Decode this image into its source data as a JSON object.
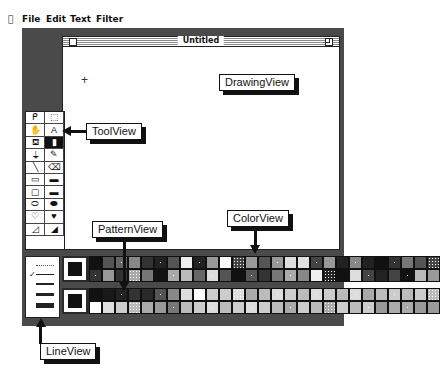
{
  "menubar": {
    "apple": "",
    "items": [
      "File",
      "Edit",
      "Text",
      "Filter"
    ]
  },
  "window": {
    "title": "Untitled",
    "cursor": "+"
  },
  "tool_palette": {
    "tools": [
      {
        "name": "lasso-icon",
        "glyph": "ᑭ"
      },
      {
        "name": "marquee-select-icon",
        "glyph": "⬚"
      },
      {
        "name": "hand-icon",
        "glyph": "✋"
      },
      {
        "name": "text-tool-icon",
        "glyph": "A"
      },
      {
        "name": "paint-bucket-icon",
        "glyph": "⛾"
      },
      {
        "name": "spray-can-icon",
        "glyph": "▮",
        "selected": true
      },
      {
        "name": "brush-icon",
        "glyph": "⍊"
      },
      {
        "name": "pencil-icon",
        "glyph": "✎"
      },
      {
        "name": "line-tool-icon",
        "glyph": "╲"
      },
      {
        "name": "eraser-icon",
        "glyph": "⌫"
      },
      {
        "name": "rectangle-icon",
        "glyph": "▭"
      },
      {
        "name": "filled-rectangle-icon",
        "glyph": "▬"
      },
      {
        "name": "rounded-rectangle-icon",
        "glyph": "▢"
      },
      {
        "name": "filled-rounded-rectangle-icon",
        "glyph": "▬"
      },
      {
        "name": "oval-icon",
        "glyph": "⬭"
      },
      {
        "name": "filled-oval-icon",
        "glyph": "⬬"
      },
      {
        "name": "freeform-shape-icon",
        "glyph": "♡"
      },
      {
        "name": "filled-freeform-shape-icon",
        "glyph": "♥"
      },
      {
        "name": "polygon-icon",
        "glyph": "◿"
      },
      {
        "name": "filled-polygon-icon",
        "glyph": "◢"
      }
    ]
  },
  "line_view": {
    "widths": [
      1,
      2,
      3,
      5
    ],
    "selected_index": 1,
    "check": "✓"
  },
  "color_view": {
    "current": "#111111",
    "cells": [
      "#111",
      "#333",
      "#555",
      "#999",
      "#666",
      "#333",
      "#888",
      "#aaa",
      "#333",
      "#777",
      "#222",
      "#111",
      "#555",
      "#aaa",
      "#eee",
      "#bbb",
      "#222",
      "#666",
      "#999",
      "#ddd",
      "#fff",
      "#555",
      "#444",
      "#111",
      "#999",
      "#555",
      "#555",
      "#333",
      "#999",
      "#777",
      "#ddd",
      "#aaa",
      "#e0e0e0",
      "#888",
      "#444",
      "#eee",
      "#999",
      "#222",
      "#222",
      "#111",
      "#888",
      "#ddd",
      "#222",
      "#444",
      "#111",
      "#222",
      "#333",
      "#444",
      "#777",
      "#111",
      "#555",
      "#bbb",
      "#444",
      "#999"
    ]
  },
  "pattern_view": {
    "current": "#111111",
    "cells": [
      "#111",
      "#fff",
      "#1a1a1a",
      "#ddd",
      "#222",
      "#ccc",
      "#333",
      "#bbb",
      "#2a2a2a",
      "#aaa",
      "#555",
      "#999",
      "#888",
      "#777",
      "#ddd",
      "#bbb",
      "#fff",
      "#ccc",
      "#ccc",
      "#ddd",
      "#ccc",
      "#bbb",
      "#ddd",
      "#ccc",
      "#aaa",
      "#ddd",
      "#bbb",
      "#ccc",
      "#ddd",
      "#bbb",
      "#ccc",
      "#aaa",
      "#bbb",
      "#ccc",
      "#ddd",
      "#bbb",
      "#ccc",
      "#aaa",
      "#bbb",
      "#ccc",
      "#ddd",
      "#bbb",
      "#aaa",
      "#ccc",
      "#bbb",
      "#999",
      "#ccc",
      "#aaa",
      "#bbb",
      "#aaa",
      "#ccc",
      "#999",
      "#bbb",
      "#999"
    ]
  },
  "callouts": {
    "drawing_view": "DrawingView",
    "tool_view": "ToolView",
    "pattern_view": "PatternView",
    "color_view": "ColorView",
    "line_view": "LineView"
  }
}
